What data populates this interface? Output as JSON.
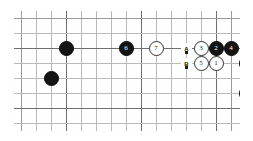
{
  "diagram": {
    "kind": "go-board-diagram",
    "title": "",
    "background_color": "#ffffff",
    "board": {
      "columns": 15,
      "rows": 9,
      "line_color": "#b9b9b9",
      "strong_line_color": "#6e6e6e",
      "cell_size": 15,
      "origin_x": 7,
      "origin_y": 7,
      "strong_columns": [
        3,
        8,
        13
      ],
      "strong_rows": [
        2,
        6
      ],
      "edge_columns": [
        0,
        14
      ],
      "edge_rows": [
        0,
        8
      ]
    },
    "stones": [
      {
        "id": "stone-black-plain-1",
        "color": "black",
        "label": "",
        "col": 3,
        "row": 2
      },
      {
        "id": "stone-black-plain-2",
        "color": "black",
        "label": "",
        "col": 2,
        "row": 4
      },
      {
        "id": "stone-black-6",
        "color": "black",
        "label": "6",
        "col": 7,
        "row": 2
      },
      {
        "id": "stone-white-7",
        "color": "white",
        "label": "7",
        "col": 9,
        "row": 2
      },
      {
        "id": "stone-white-3",
        "color": "white",
        "label": "3",
        "col": 12,
        "row": 2
      },
      {
        "id": "stone-black-2",
        "color": "black",
        "label": "2",
        "col": 13,
        "row": 2
      },
      {
        "id": "stone-black-4",
        "color": "black",
        "label": "4",
        "col": 14,
        "row": 2
      },
      {
        "id": "stone-white-5",
        "color": "white",
        "label": "5",
        "col": 12,
        "row": 3
      },
      {
        "id": "stone-white-1",
        "color": "white",
        "label": "1",
        "col": 13,
        "row": 3
      },
      {
        "id": "stone-black-plain-3",
        "color": "black",
        "label": "",
        "col": 15,
        "row": 3
      },
      {
        "id": "stone-black-8",
        "color": "black",
        "label": "8",
        "col": 15,
        "row": 5
      }
    ],
    "point_labels": [
      {
        "id": "point-label-a",
        "label": "A",
        "col": 11,
        "row": 2
      },
      {
        "id": "point-label-b",
        "label": "B",
        "col": 11,
        "row": 3
      }
    ]
  }
}
